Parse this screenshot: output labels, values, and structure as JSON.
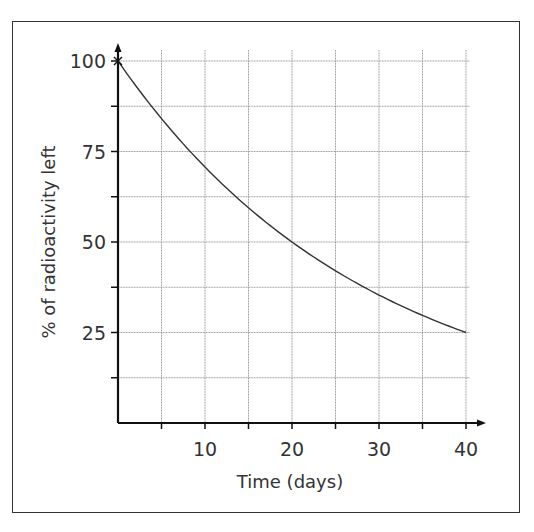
{
  "chart_data": {
    "type": "line",
    "title": "",
    "xlabel": "Time (days)",
    "ylabel": "% of radioactivity left",
    "xlim": [
      0,
      40
    ],
    "ylim": [
      0,
      100
    ],
    "x_ticks": [
      10,
      20,
      30,
      40
    ],
    "x_minor_ticks": [
      5,
      15,
      25,
      35
    ],
    "y_ticks": [
      25,
      50,
      75,
      100
    ],
    "y_minor_ticks": [
      12.5,
      37.5,
      62.5,
      87.5
    ],
    "grid": true,
    "legend": "none",
    "series": [
      {
        "name": "radioactive decay",
        "half_life_days": 20,
        "x": [
          0,
          5,
          10,
          15,
          20,
          25,
          30,
          35,
          40
        ],
        "y": [
          100,
          84.1,
          70.7,
          59.5,
          50,
          42,
          35.4,
          29.7,
          25
        ]
      }
    ],
    "start_marker": {
      "x": 0,
      "y": 100,
      "symbol": "x"
    }
  },
  "colors": {
    "line": "#333333",
    "grid": "#999999",
    "axis": "#111111"
  }
}
